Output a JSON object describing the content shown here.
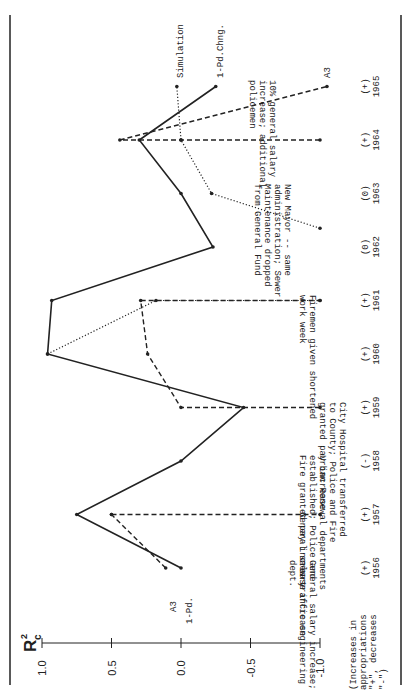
{
  "chart_data": {
    "type": "line",
    "orientation": "rotated-90-ccw",
    "ylabel": "R²c",
    "ylabel_main": "R",
    "ylabel_sup": "2",
    "ylabel_sub": "c",
    "ylim": [
      -1.0,
      1.0
    ],
    "yticks": [
      "1.0",
      "0.5",
      "0.0",
      "-0.5",
      "-1.0"
    ],
    "x_caption": [
      "(Increases in",
      "appropriations",
      "\"+\", decreases",
      "\"-\")"
    ],
    "categories": [
      "1956",
      "1957",
      "1958",
      "1959",
      "1960",
      "1961",
      "1962",
      "1963",
      "1964",
      "1965"
    ],
    "category_signs": [
      "(+)",
      "(+)",
      "(-)",
      "(+)",
      "(+)",
      "(+)",
      "(0)",
      "(0)",
      "(+)",
      "(+)"
    ],
    "series": [
      {
        "name": "1-Pd. Chng.",
        "style": "solid",
        "points": [
          [
            1956,
            0.0
          ],
          [
            1957,
            0.75
          ],
          [
            1958,
            0.0
          ],
          [
            1959,
            -0.45
          ],
          [
            1960,
            0.96
          ],
          [
            1961,
            0.93
          ],
          [
            1962,
            -0.23
          ],
          [
            1963,
            0.0
          ],
          [
            1964,
            0.3
          ],
          [
            1965,
            -0.25
          ]
        ]
      },
      {
        "name": "A3",
        "style": "dashed",
        "segments": [
          [
            [
              1956,
              0.11
            ],
            [
              1957,
              0.5
            ]
          ],
          [
            [
              1957,
              0.5
            ],
            [
              1957,
              -1.0
            ]
          ],
          [
            [
              1959,
              -1.0
            ],
            [
              1959,
              0.0
            ],
            [
              1960,
              0.24
            ],
            [
              1961,
              0.29
            ],
            [
              1961,
              -1.0
            ]
          ],
          [
            [
              1964,
              -1.0
            ],
            [
              1964,
              0.0
            ],
            [
              1964,
              0.44
            ],
            [
              1965,
              -1.05
            ]
          ]
        ]
      },
      {
        "name": "Simulation",
        "style": "dotted",
        "points_segments": [
          [
            [
              1960,
              0.96
            ],
            [
              1961,
              0.18
            ],
            [
              1961,
              -1.0
            ]
          ],
          [
            [
              1962.35,
              -1.0
            ],
            [
              1963,
              -0.22
            ],
            [
              1964,
              0.0
            ],
            [
              1965,
              0.03
            ]
          ]
        ]
      }
    ],
    "series_labels": {
      "solid_start": "1-Pd.",
      "dashed_start": "A3",
      "solid_end": "1-Pd.Chng.",
      "dotted_end": "Simulation",
      "dashed_end": "A3"
    },
    "annotations": [
      {
        "year": "1956",
        "lines": [
          "General salary increase;",
          "new traffic engineering",
          "dept."
        ]
      },
      {
        "year": "1957",
        "lines": [
          "General salary increase"
        ]
      },
      {
        "year": "1958",
        "lines": [
          "Urban Renewal departments",
          "established; Police and",
          "Fire granted pay increase"
        ]
      },
      {
        "year": "1959",
        "lines": [
          "City Hospital transferred",
          "to County; Police and Fire",
          "granted pay increase"
        ]
      },
      {
        "year": "1961",
        "lines": [
          "Firemen given shortened",
          "work week"
        ]
      },
      {
        "year": "1963",
        "lines": [
          "New Mayor -- same",
          "administration; Sewer",
          "Maintenance dropped",
          "from General Fund"
        ]
      },
      {
        "year": "1965",
        "lines": [
          "10% general salary",
          "increase; additional",
          "policemen"
        ]
      }
    ]
  }
}
